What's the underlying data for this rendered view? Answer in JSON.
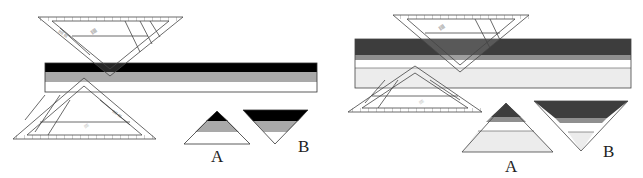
{
  "figure": {
    "panels": [
      {
        "id": "left",
        "strip": {
          "x": 45,
          "y": 63,
          "width": 272,
          "bands": [
            {
              "color": "#000000",
              "height": 9
            },
            {
              "color": "#a9a9a9",
              "height": 10
            },
            {
              "color": "#ffffff",
              "height": 10
            }
          ]
        },
        "labels": {
          "a": "A",
          "b": "B"
        }
      },
      {
        "id": "right",
        "strip": {
          "x": 355,
          "y": 39,
          "width": 276,
          "bands": [
            {
              "color": "#3d3d3d",
              "height": 16
            },
            {
              "color": "#8f8f8f",
              "height": 5
            },
            {
              "color": "#ffffff",
              "height": 8
            },
            {
              "color": "#ececec",
              "height": 20
            }
          ]
        },
        "labels": {
          "a": "A",
          "b": "B"
        }
      }
    ]
  }
}
